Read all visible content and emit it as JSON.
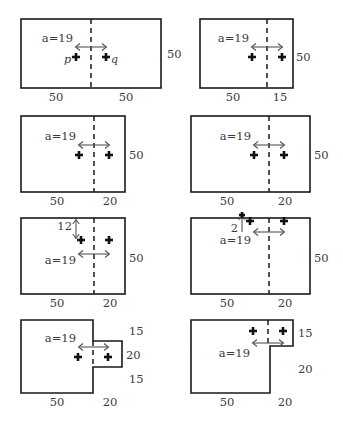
{
  "figure": {
    "distance_label": "a=19",
    "point_labels": {
      "left": "p",
      "right": "q"
    },
    "marker_glyph": "+"
  },
  "panels": [
    {
      "id": "panel-1",
      "shape": "rectangle",
      "bottom_dims": [
        "50",
        "50"
      ],
      "right_dims": [
        "50"
      ],
      "extra_dims": [],
      "distance": "a=19",
      "show_pq_labels": true,
      "p_label": "p",
      "q_label": "q"
    },
    {
      "id": "panel-2",
      "shape": "rectangle",
      "bottom_dims": [
        "50",
        "15"
      ],
      "right_dims": [
        "50"
      ],
      "extra_dims": [],
      "distance": "a=19",
      "show_pq_labels": false,
      "p_label": "",
      "q_label": ""
    },
    {
      "id": "panel-3",
      "shape": "rectangle",
      "bottom_dims": [
        "50",
        "20"
      ],
      "right_dims": [
        "50"
      ],
      "extra_dims": [],
      "distance": "a=19",
      "show_pq_labels": false,
      "p_label": "",
      "q_label": ""
    },
    {
      "id": "panel-4",
      "shape": "rectangle",
      "bottom_dims": [
        "50",
        "20"
      ],
      "right_dims": [
        "50"
      ],
      "extra_dims": [],
      "distance": "a=19",
      "show_pq_labels": false,
      "p_label": "",
      "q_label": ""
    },
    {
      "id": "panel-5",
      "shape": "rectangle",
      "bottom_dims": [
        "50",
        "20"
      ],
      "right_dims": [
        "50"
      ],
      "extra_dims": [
        "12"
      ],
      "vertical_offset": "12",
      "distance": "a=19",
      "show_pq_labels": false,
      "p_label": "",
      "q_label": ""
    },
    {
      "id": "panel-6",
      "shape": "rectangle",
      "bottom_dims": [
        "50",
        "20"
      ],
      "right_dims": [
        "50"
      ],
      "extra_dims": [
        "2"
      ],
      "vertical_offset": "2",
      "distance": "a=19",
      "show_pq_labels": false,
      "p_label": "",
      "q_label": ""
    },
    {
      "id": "panel-7",
      "shape": "square-with-right-tab",
      "bottom_dims": [
        "50",
        "20"
      ],
      "right_dims": [
        "15",
        "20",
        "15"
      ],
      "extra_dims": [],
      "distance": "a=19",
      "show_pq_labels": false,
      "p_label": "",
      "q_label": ""
    },
    {
      "id": "panel-8",
      "shape": "l-shape-notch-bottom-right",
      "bottom_dims": [
        "50",
        "20"
      ],
      "right_dims": [
        "15",
        "20"
      ],
      "extra_dims": [],
      "distance": "a=19",
      "show_pq_labels": false,
      "p_label": "",
      "q_label": ""
    }
  ]
}
